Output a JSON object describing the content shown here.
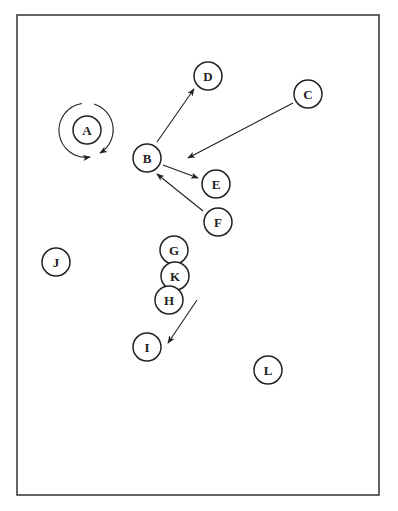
{
  "diagram": {
    "frame": {
      "x": 17,
      "y": 15,
      "width": 362,
      "height": 480,
      "stroke": "#333333"
    },
    "node_radius": 14,
    "nodes": [
      {
        "id": "A",
        "label": "A",
        "x": 87,
        "y": 130
      },
      {
        "id": "B",
        "label": "B",
        "x": 147,
        "y": 158
      },
      {
        "id": "C",
        "label": "C",
        "x": 308,
        "y": 94
      },
      {
        "id": "D",
        "label": "D",
        "x": 208,
        "y": 76
      },
      {
        "id": "E",
        "label": "E",
        "x": 216,
        "y": 184
      },
      {
        "id": "F",
        "label": "F",
        "x": 218,
        "y": 222
      },
      {
        "id": "G",
        "label": "G",
        "x": 174,
        "y": 250
      },
      {
        "id": "K",
        "label": "K",
        "x": 175,
        "y": 276
      },
      {
        "id": "H",
        "label": "H",
        "x": 169,
        "y": 300
      },
      {
        "id": "I",
        "label": "I",
        "x": 147,
        "y": 347
      },
      {
        "id": "J",
        "label": "J",
        "x": 56,
        "y": 262
      },
      {
        "id": "L",
        "label": "L",
        "x": 268,
        "y": 370
      }
    ],
    "edges": [
      {
        "name": "edge-b-to-d",
        "x1": 157,
        "y1": 142,
        "x2": 194,
        "y2": 89
      },
      {
        "name": "edge-c-to-b",
        "x1": 293,
        "y1": 103,
        "x2": 188,
        "y2": 158
      },
      {
        "name": "edge-b-to-e",
        "x1": 163,
        "y1": 165,
        "x2": 198,
        "y2": 178
      },
      {
        "name": "edge-f-to-b",
        "x1": 203,
        "y1": 211,
        "x2": 157,
        "y2": 174
      },
      {
        "name": "edge-h-to-i",
        "x1": 197,
        "y1": 300,
        "x2": 168,
        "y2": 343
      }
    ],
    "self_loop": {
      "node": "A",
      "radius": 27
    }
  }
}
